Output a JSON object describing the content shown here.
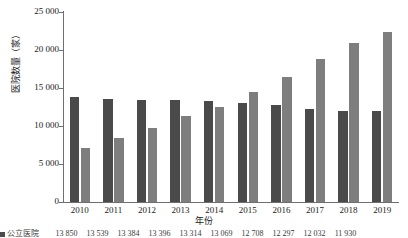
{
  "chart_data": {
    "type": "bar",
    "title": "",
    "xlabel": "年份",
    "ylabel": "医院数量（家）",
    "categories": [
      "2010",
      "2011",
      "2012",
      "2013",
      "2014",
      "2015",
      "2016",
      "2017",
      "2018",
      "2019"
    ],
    "series": [
      {
        "name": "公立医院",
        "color": "#4a4a4a",
        "values": [
          13850,
          13539,
          13384,
          13396,
          13314,
          13069,
          12708,
          12297,
          12032,
          11930
        ]
      },
      {
        "name": "民营医院",
        "color": "#7e7e7e",
        "values": [
          7068,
          8440,
          9786,
          11313,
          12546,
          14518,
          16432,
          18759,
          20977,
          22424
        ]
      }
    ],
    "ylim": [
      0,
      25000
    ],
    "yticks": [
      "0",
      "5 000",
      "10 000",
      "15 000",
      "20 000",
      "25 000"
    ],
    "ytick_values": [
      0,
      5000,
      10000,
      15000,
      20000,
      25000
    ],
    "grid": false,
    "legend_position": "bottom"
  },
  "axis": {
    "y_title": "医院数量（家）",
    "x_title": "年份"
  },
  "data_table": {
    "row_label": "公立医院",
    "values": [
      "13 850",
      "13 539",
      "13 384",
      "13 396",
      "13 314",
      "13 069",
      "12 708",
      "12 297",
      "12 032",
      "11 930"
    ]
  }
}
